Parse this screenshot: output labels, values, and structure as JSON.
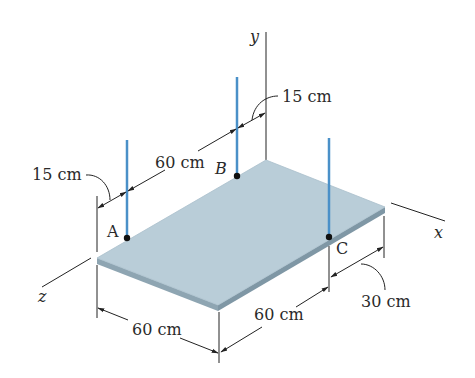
{
  "figure": {
    "axes": {
      "x": "x",
      "y": "y",
      "z": "z"
    },
    "points": {
      "A": "A",
      "B": "B",
      "C": "C"
    },
    "dimensions": {
      "top_left_offset": "15 cm",
      "top_AB": "60 cm",
      "top_right_offset": "15 cm",
      "bottom_left": "60 cm",
      "bottom_mid": "60 cm",
      "bottom_right": "30 cm"
    },
    "colors": {
      "plate_top": "#b9cdd8",
      "plate_edge": "#8ea5b2",
      "cable": "#4a90c8",
      "line": "#222222"
    }
  }
}
